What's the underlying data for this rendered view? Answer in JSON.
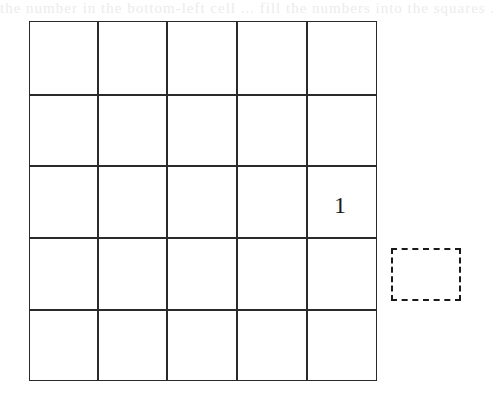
{
  "figure": {
    "type": "grid-puzzle",
    "rows": 5,
    "columns": 5,
    "line_color": "#2a2a2a",
    "background": "#ffffff",
    "header_bleed_text": "the number in the bottom-left cell ... fill the numbers into the squares ... the square to the right of the grid",
    "cells": [
      {
        "row": 3,
        "column": 5,
        "value": "1"
      }
    ],
    "outside_box": {
      "style": "dashed",
      "position": "right of row 4",
      "value": ""
    }
  }
}
